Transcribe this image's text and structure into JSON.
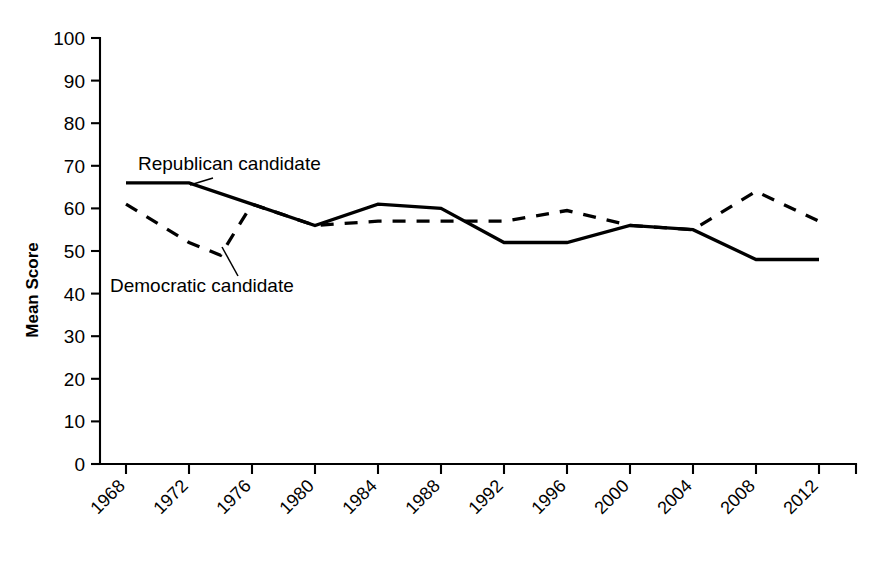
{
  "chart_data": {
    "type": "line",
    "title": "",
    "xlabel": "",
    "ylabel": "Mean Score",
    "ylim": [
      0,
      100
    ],
    "ytick_step": 10,
    "yticks": [
      "0",
      "10",
      "20",
      "30",
      "40",
      "50",
      "60",
      "70",
      "80",
      "90",
      "100"
    ],
    "grid": false,
    "legend_position": "inline-annotations",
    "categories": [
      "1968",
      "1972",
      "1976",
      "1980",
      "1984",
      "1988",
      "1992",
      "1996",
      "2000",
      "2004",
      "2008",
      "2012"
    ],
    "series": [
      {
        "name": "Republican candidate",
        "style": "solid",
        "color": "#000000",
        "values": [
          66,
          66,
          61,
          56,
          61,
          60,
          52,
          52,
          56,
          55,
          48,
          48
        ]
      },
      {
        "name": "Democratic candidate",
        "style": "dashed",
        "color": "#000000",
        "values": [
          61,
          52,
          61,
          56,
          57,
          57,
          57,
          59.5,
          56,
          55,
          64,
          57
        ],
        "extra_points": [
          {
            "x": 1974,
            "y": 49,
            "note": "dip between 1972 and 1976"
          }
        ]
      }
    ],
    "annotations": [
      {
        "text": "Republican candidate",
        "target_series": "Republican candidate"
      },
      {
        "text": "Democratic candidate",
        "target_series": "Democratic candidate"
      }
    ]
  },
  "axis": {
    "y_title": "Mean Score",
    "y_labels": [
      "100",
      "90",
      "80",
      "70",
      "60",
      "50",
      "40",
      "30",
      "20",
      "10",
      "0"
    ],
    "x_labels": [
      "1968",
      "1972",
      "1976",
      "1980",
      "1984",
      "1988",
      "1992",
      "1996",
      "2000",
      "2004",
      "2008",
      "2012"
    ]
  },
  "annotations": {
    "republican": "Republican candidate",
    "democratic": "Democratic candidate"
  }
}
